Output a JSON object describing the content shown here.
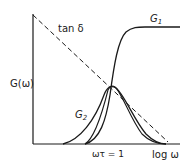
{
  "diagram": {
    "colors": {
      "ink": "#1a1a1a",
      "background": "#ffffff"
    },
    "axes": {
      "y_label": "G(ω)",
      "x_label": "log ω",
      "x_marker_label": "ωτ = 1"
    },
    "curves": [
      {
        "id": "G1",
        "label_main": "G",
        "label_sub": "1",
        "style": "solid",
        "shape": "sigmoid rising to plateau"
      },
      {
        "id": "G2",
        "label_main": "G",
        "label_sub": "2",
        "style": "solid",
        "shape": "peak at ωτ = 1"
      },
      {
        "id": "tan_delta",
        "label": "tan δ",
        "style": "dashed",
        "shape": "straight line decreasing"
      }
    ]
  }
}
